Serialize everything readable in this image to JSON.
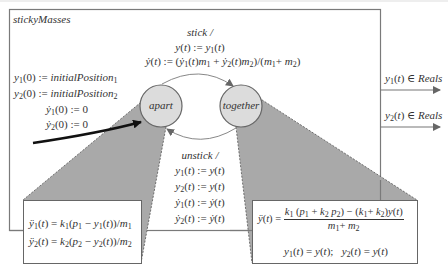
{
  "model": {
    "name": "stickyMasses",
    "states": [
      {
        "id": "apart",
        "label": "apart"
      },
      {
        "id": "together",
        "label": "together"
      }
    ],
    "initial_actions": [
      "y1(0) := initialPosition1",
      "y2(0) := initialPosition2",
      "ẏ1(0) := 0",
      "ẏ2(0) := 0"
    ],
    "transitions": {
      "stick": {
        "guard": "stick /",
        "actions": [
          "y(t) := y1(t)",
          "ẏ(t) := (ẏ1(t)m1 + ẏ2(t)m2)/(m1+ m2)"
        ]
      },
      "unstick": {
        "guard": "unstick /",
        "actions": [
          "y1(t) := y(t)",
          "y2(t) := y(t)",
          "ẏ1(t) := ẏ(t)",
          "ẏ2(t) := ẏ(t)"
        ]
      }
    },
    "outputs": [
      "y1(t) ∈ Reals",
      "y2(t) ∈ Reals"
    ],
    "refinements": {
      "apart": [
        "ÿ1(t) = k1(p1 − y1(t))/m1",
        "ÿ2(t) = k2(p2 − y2(t))/m2"
      ],
      "together": {
        "lhs": "ÿ(t) =",
        "numerator": "k1 (p1 + k2 p2) − (k1 + k2)y(t)",
        "denominator": "m1+ m2",
        "line2": "y1(t) = y(t);   y2(t) = y(t)"
      }
    }
  },
  "colors": {
    "frame": "#7a7a7a",
    "state_fill": "#dcdcdc",
    "refinement_shade": "#a9a9a9",
    "text": "#333333"
  }
}
